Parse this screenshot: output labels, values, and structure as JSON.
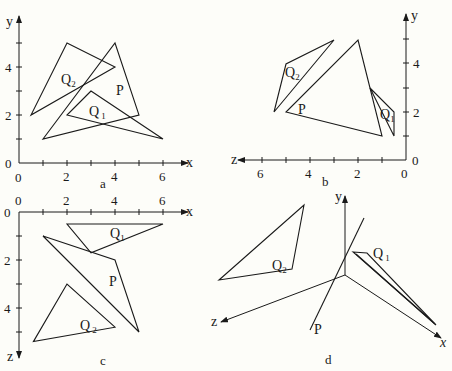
{
  "figure": {
    "panels": [
      {
        "id": "a",
        "caption": "a",
        "view": "x-y projection",
        "axes": {
          "horizontal": "x",
          "vertical": "y",
          "origin_label_h": "0",
          "origin_label_v": "0",
          "h_ticks": [
            "2",
            "4",
            "6"
          ],
          "v_ticks": [
            "2",
            "4"
          ]
        },
        "shapes": [
          {
            "name": "Q2",
            "label": "Q",
            "sub": "2",
            "points": [
              [
                2,
                5
              ],
              [
                0.5,
                2
              ],
              [
                4,
                4
              ]
            ]
          },
          {
            "name": "P",
            "label": "P",
            "sub": "",
            "points": [
              [
                4,
                5
              ],
              [
                5,
                2
              ],
              [
                1,
                1
              ]
            ]
          },
          {
            "name": "Q1",
            "label": "Q",
            "sub": "1",
            "points": [
              [
                3,
                3
              ],
              [
                2,
                2
              ],
              [
                6,
                1
              ]
            ]
          }
        ]
      },
      {
        "id": "b",
        "caption": "b",
        "view": "z-y projection",
        "axes": {
          "horizontal": "z",
          "vertical": "y",
          "origin_label_h": "0",
          "origin_label_v": "0",
          "h_ticks": [
            "2",
            "4",
            "6"
          ],
          "v_ticks": [
            "2",
            "4"
          ]
        },
        "shapes": [
          {
            "name": "Q2",
            "label": "Q",
            "sub": "2",
            "points": [
              [
                5,
                4
              ],
              [
                5.5,
                2
              ],
              [
                3,
                5
              ]
            ]
          },
          {
            "name": "P",
            "label": "P",
            "sub": "",
            "points": [
              [
                2,
                5
              ],
              [
                1,
                1
              ],
              [
                5,
                2
              ]
            ]
          },
          {
            "name": "Q1",
            "label": "Q",
            "sub": "1",
            "points": [
              [
                1.5,
                3
              ],
              [
                0.5,
                2
              ],
              [
                0.5,
                1
              ]
            ]
          }
        ]
      },
      {
        "id": "c",
        "caption": "c",
        "view": "x-z projection",
        "axes": {
          "horizontal": "x",
          "vertical": "z",
          "origin_label_h": "0",
          "origin_label_v": "0",
          "h_ticks": [
            "2",
            "4",
            "6"
          ],
          "v_ticks": [
            "2",
            "4"
          ]
        },
        "shapes": [
          {
            "name": "Q1",
            "label": "Q",
            "sub": "1",
            "points": [
              [
                2,
                0.5
              ],
              [
                6,
                0.5
              ],
              [
                3,
                1.7
              ]
            ]
          },
          {
            "name": "P",
            "label": "P",
            "sub": "",
            "points": [
              [
                1,
                1
              ],
              [
                4,
                2
              ],
              [
                5,
                5
              ]
            ]
          },
          {
            "name": "Q2",
            "label": "Q",
            "sub": "2",
            "points": [
              [
                2,
                3
              ],
              [
                0.6,
                5.4
              ],
              [
                4,
                4.8
              ]
            ]
          }
        ]
      },
      {
        "id": "d",
        "caption": "d",
        "view": "perspective 3D",
        "axes": {
          "x_label": "x",
          "y_label": "y",
          "z_label": "z"
        },
        "shapes": [
          {
            "name": "Q2",
            "label": "Q",
            "sub": "2"
          },
          {
            "name": "P",
            "label": "P",
            "sub": ""
          },
          {
            "name": "Q1",
            "label": "Q",
            "sub": "1"
          }
        ]
      }
    ]
  }
}
